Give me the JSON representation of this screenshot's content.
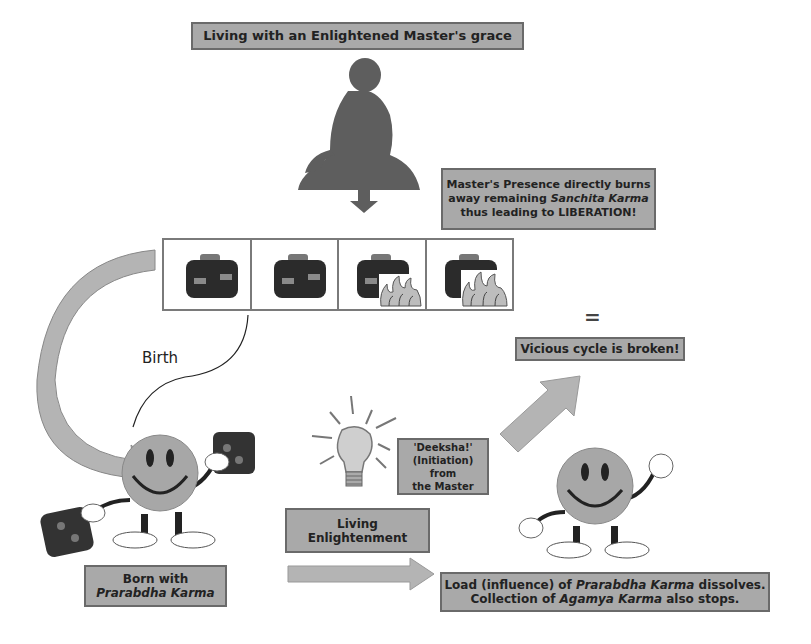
{
  "title": "Living with an Enlightened Master's grace",
  "master_presence": {
    "line1": "Master's Presence directly burns",
    "line2_pre": "away remaining ",
    "line2_italic": "Sanchita Karma",
    "line3": "thus leading to LIBERATION!"
  },
  "karma_bags": [
    {
      "state": "intact"
    },
    {
      "state": "intact"
    },
    {
      "state": "burning"
    },
    {
      "state": "burning"
    }
  ],
  "birth_label": "Birth",
  "equals_sign": "=",
  "vicious_cycle": "Vicious cycle is broken!",
  "deeksha": {
    "line1": "'Deeksha!'",
    "line2": "(Initiation) from",
    "line3": "the Master"
  },
  "living_enlightenment": {
    "line1": "Living",
    "line2": "Enlightenment"
  },
  "born_with": {
    "line1": "Born with",
    "line2_italic": "Prarabdha Karma"
  },
  "load_dissolves": {
    "line1_pre": "Load (influence) of ",
    "line1_italic": "Prarabdha Karma",
    "line1_post": " dissolves.",
    "line2_pre": "Collection of ",
    "line2_italic": "Agamya Karma",
    "line2_post": " also stops."
  },
  "colors": {
    "box_fill": "#a9a9a9",
    "box_border": "#6a6a6a",
    "arrow_fill": "#b4b4b4",
    "silhouette": "#5e5e5e"
  }
}
